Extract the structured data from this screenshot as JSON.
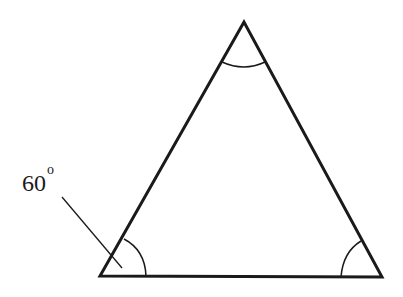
{
  "diagram": {
    "type": "triangle",
    "vertices": {
      "apex": [
        244,
        22
      ],
      "bottom_left": [
        100,
        276
      ],
      "bottom_right": [
        382,
        277
      ]
    },
    "angle_label": {
      "value": "60",
      "unit_symbol": "o",
      "target_vertex": "bottom_left"
    },
    "stroke_color": "#1a1a1a",
    "background": "#ffffff"
  }
}
